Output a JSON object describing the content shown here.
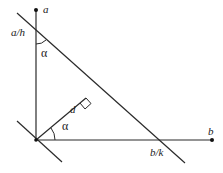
{
  "diagram": {
    "labels": {
      "a": "a",
      "b": "b",
      "a_over_h": "a/h",
      "b_over_k": "b/k",
      "d": "d",
      "alpha_top": "α",
      "alpha_bottom": "α"
    },
    "colors": {
      "line": "#2a2a2a",
      "background": "#ffffff"
    }
  }
}
